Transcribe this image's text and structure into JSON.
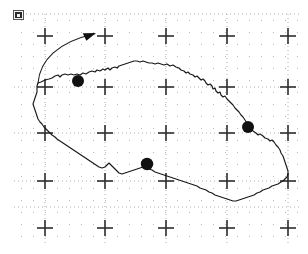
{
  "figure": {
    "kind": "map",
    "region_name": "Czech Republic",
    "background_color": "#ffffff",
    "outline_color": "#1a1a1a",
    "grid_color": "#9a9a9a",
    "grid_minor_color": "#bdbdbd",
    "marker_color": "#111111",
    "width": 308,
    "height": 254
  },
  "badge": {
    "name": "north-arrow-badge",
    "label": ""
  },
  "grid": {
    "major_x": [
      45,
      105,
      166,
      227,
      288
    ],
    "major_y": [
      36,
      87,
      133,
      181,
      228
    ],
    "minor_step": 12,
    "tick_half_length": 8,
    "dotted": true,
    "major_vertical_lines": [
      45,
      105,
      166,
      227,
      288
    ],
    "major_horizontal_lines": [
      14,
      87,
      133,
      181,
      207
    ],
    "cross_count": 25
  },
  "markers": [
    {
      "name": "city-dot-prague",
      "x": 78,
      "y": 81,
      "r": 6.0,
      "label": ""
    },
    {
      "name": "city-dot-ostrava",
      "x": 248,
      "y": 127,
      "r": 6.0,
      "label": ""
    },
    {
      "name": "city-dot-brno",
      "x": 147,
      "y": 164,
      "r": 6.2,
      "label": ""
    }
  ],
  "annotation": {
    "name": "curved-pointer-arrow",
    "path": "M 38,83 C 40,60 58,42 94,34",
    "arrow_tip_x": 96,
    "arrow_tip_y": 33,
    "arrow_angle_deg": -12,
    "stroke_width": 1.1
  },
  "border_outline": {
    "name": "country-border-path",
    "stroke_width": 1.15,
    "path": "M 38,83 L 41,82 L 45,80 L 49,79 L 52,78 L 55,76 L 58,75 L 60,77 L 62,75 L 65,74 L 68,75 L 71,74 L 74,75 L 77,74 L 80,75 L 83,73 L 86,74 L 89,72 L 92,71 L 95,72 L 97,70 L 100,71 L 103,69 L 105,70 L 108,68 L 110,70 L 112,68 L 115,67 L 117,68 L 119,66 L 122,65 L 125,64 L 128,63 L 131,62 L 134,61 L 137,61 L 140,62 L 143,61 L 146,62 L 149,63 L 152,63 L 155,64 L 158,63 L 161,64 L 164,65 L 167,64 L 170,66 L 173,65 L 176,67 L 179,68 L 181,70 L 184,71 L 186,73 L 188,72 L 190,74 L 193,75 L 195,77 L 197,76 L 199,78 L 201,80 L 203,79 L 205,81 L 206,83 L 208,85 L 210,84 L 212,86 L 213,89 L 215,88 L 216,91 L 218,93 L 220,92 L 221,95 L 223,97 L 225,96 L 227,99 L 229,101 L 231,103 L 233,105 L 235,108 L 237,110 L 239,112 L 241,115 L 243,117 L 245,120 L 247,123 L 249,126 L 251,129 L 253,131 L 256,133 L 258,135 L 260,134 L 263,136 L 265,138 L 268,139 L 270,141 L 272,140 L 274,142 L 276,145 L 278,147 L 280,150 L 281,153 L 283,156 L 284,159 L 285,162 L 286,165 L 287,168 L 288,171 L 288,174 L 287,177 L 285,179 L 283,181 L 281,182 L 278,184 L 275,185 L 272,186 L 269,188 L 266,189 L 263,190 L 260,192 L 257,193 L 254,195 L 251,196 L 248,197 L 245,198 L 242,199 L 239,200 L 236,201 L 233,201 L 230,200 L 227,199 L 224,198 L 221,197 L 218,196 L 215,195 L 212,193 L 209,192 L 206,190 L 203,189 L 200,188 L 197,186 L 194,185 L 191,184 L 188,183 L 185,182 L 182,181 L 179,180 L 176,179 L 173,178 L 170,177 L 167,176 L 164,175 L 161,174 L 158,173 L 155,172 L 152,170 L 149,169 L 146,167 L 143,167 L 140,168 L 137,169 L 134,170 L 131,171 L 128,172 L 125,173 L 122,174 L 119,173 L 117,171 L 115,169 L 113,167 L 111,165 L 109,163 L 107,165 L 105,167 L 102,168 L 99,167 L 96,165 L 93,163 L 90,161 L 87,159 L 84,157 L 81,155 L 78,153 L 75,151 L 72,149 L 69,147 L 66,145 L 63,143 L 60,141 L 57,139 L 55,137 L 52,135 L 50,133 L 48,131 L 46,129 L 44,127 L 42,124 L 40,122 L 38,119 L 37,116 L 36,113 L 35,110 L 34,107 L 33,104 L 34,101 L 35,98 L 36,95 L 37,92 L 37,89 L 37,86 L 38,83 Z"
  }
}
